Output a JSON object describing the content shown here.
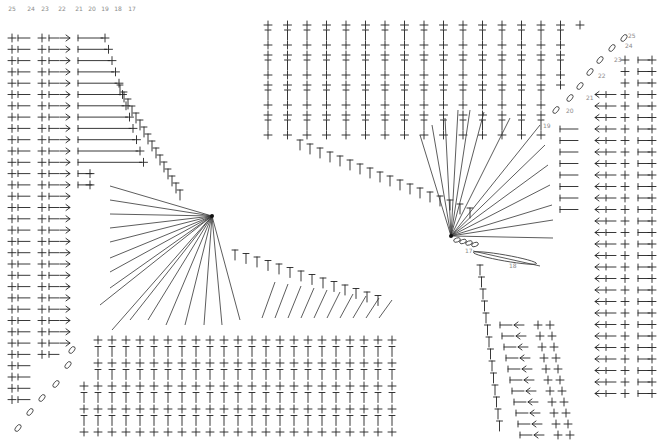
{
  "diagram": {
    "type": "crochet-stitch-chart",
    "background": "#ffffff",
    "ink_color": "#222222",
    "label_color": "#8a8a8a",
    "left_panel": {
      "row_labels": [
        "25",
        "24",
        "23",
        "22",
        "21",
        "20",
        "19",
        "18",
        "17"
      ],
      "row_label_x": [
        12,
        31,
        45,
        62,
        79,
        92,
        105,
        118,
        132
      ],
      "rows": 33,
      "row_start_y": 38,
      "row_step": 11.3,
      "symbols_per_row": [
        "sc",
        "hdc-line",
        "sc",
        "hdc-line",
        "sc-dec",
        "dc",
        "sc",
        "sc",
        "sc-inc",
        "hdc-line"
      ]
    },
    "right_panel": {
      "row_labels": [
        "25",
        "24",
        "23",
        "22",
        "21",
        "20",
        "19",
        "18",
        "17"
      ],
      "rows": 33,
      "row_start_y": 25,
      "columns": 17,
      "col_start_x": 268,
      "col_step": 19.5
    },
    "fan_centers": [
      {
        "name": "left-fan",
        "x": 212,
        "y": 216
      },
      {
        "name": "right-fan",
        "x": 451,
        "y": 236
      }
    ],
    "stitch_labels": [
      {
        "text": "25",
        "x": 628,
        "y": 38
      },
      {
        "text": "24",
        "x": 625,
        "y": 48
      },
      {
        "text": "23",
        "x": 614,
        "y": 62
      },
      {
        "text": "22",
        "x": 598,
        "y": 78
      },
      {
        "text": "21",
        "x": 586,
        "y": 100
      },
      {
        "text": "20",
        "x": 566,
        "y": 113
      },
      {
        "text": "19",
        "x": 543,
        "y": 128
      },
      {
        "text": "18",
        "x": 509,
        "y": 268
      },
      {
        "text": "17",
        "x": 465,
        "y": 253
      }
    ]
  }
}
